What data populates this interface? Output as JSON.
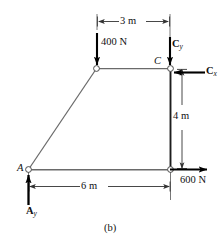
{
  "figure": {
    "caption": "(b)",
    "background_color": "#ffffff",
    "member_color": "#555555",
    "force_color": "#000000",
    "dimension_color": "#444444"
  },
  "points": [
    {
      "id": "A",
      "label": "A",
      "x": 28,
      "y": 170
    },
    {
      "id": "B",
      "label": "",
      "x": 97,
      "y": 68
    },
    {
      "id": "C",
      "label": "C",
      "x": 170,
      "y": 68
    },
    {
      "id": "D",
      "label": "",
      "x": 170,
      "y": 170
    }
  ],
  "forces": [
    {
      "id": "load-400n",
      "label": "400 N",
      "magnitude": 400,
      "unit": "N",
      "direction": "down",
      "at": "B"
    },
    {
      "id": "reaction-cy",
      "label": "C",
      "subscript": "y",
      "direction": "down",
      "at": "C"
    },
    {
      "id": "reaction-cx",
      "label": "C",
      "subscript": "x",
      "direction": "left",
      "at": "C"
    },
    {
      "id": "load-600n",
      "label": "600 N",
      "magnitude": 600,
      "unit": "N",
      "direction": "right",
      "at": "D"
    },
    {
      "id": "reaction-ay",
      "label": "A",
      "subscript": "y",
      "direction": "up",
      "at": "A"
    }
  ],
  "dimensions": [
    {
      "id": "dim-top",
      "label": "3 m",
      "value": 3,
      "unit": "m",
      "orientation": "horizontal",
      "position": "top"
    },
    {
      "id": "dim-right",
      "label": "4 m",
      "value": 4,
      "unit": "m",
      "orientation": "vertical",
      "position": "right"
    },
    {
      "id": "dim-bottom",
      "label": "6 m",
      "value": 6,
      "unit": "m",
      "orientation": "horizontal",
      "position": "bottom"
    }
  ]
}
